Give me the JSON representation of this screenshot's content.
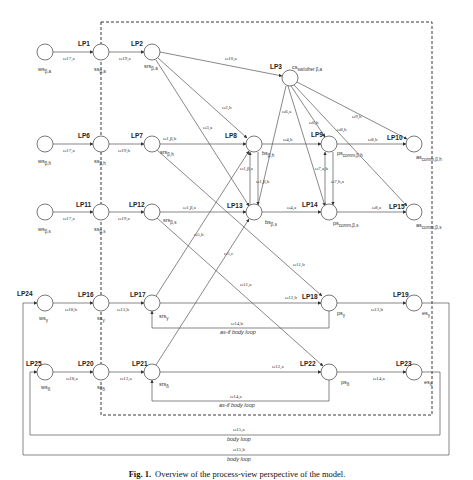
{
  "figure": {
    "caption_prefix": "Fig. 1.",
    "caption_text": "Overview of the process-view perspective of the model."
  },
  "nodes": [
    {
      "id": "ws_a",
      "label": "ws",
      "sub": "β,a",
      "x": 45,
      "y": 52
    },
    {
      "id": "ss_a",
      "label": "ss",
      "sub": "β,a",
      "x": 101,
      "y": 52
    },
    {
      "id": "srs_a",
      "label": "srs",
      "sub": "β,a",
      "x": 152,
      "y": 52
    },
    {
      "id": "cs",
      "label": "cs",
      "sub": "sw/other β,a",
      "x": 290,
      "y": 78
    },
    {
      "id": "ws_h",
      "label": "ws",
      "sub": "β,h",
      "x": 45,
      "y": 144
    },
    {
      "id": "ss_h",
      "label": "ss",
      "sub": "β,h",
      "x": 101,
      "y": 144
    },
    {
      "id": "srs_h",
      "label": "srs",
      "sub": "β,h",
      "x": 152,
      "y": 144
    },
    {
      "id": "bs_h",
      "label": "bs",
      "sub": "β,h",
      "x": 254,
      "y": 144
    },
    {
      "id": "ps_h",
      "label": "ps",
      "sub": "comm,β,h",
      "x": 329,
      "y": 144
    },
    {
      "id": "as_h",
      "label": "as",
      "sub": "comm,β,h",
      "x": 414,
      "y": 144
    },
    {
      "id": "ws_s",
      "label": "ws",
      "sub": "β,s",
      "x": 45,
      "y": 212
    },
    {
      "id": "ss_s",
      "label": "ss",
      "sub": "β,s",
      "x": 101,
      "y": 212
    },
    {
      "id": "srs_s",
      "label": "srs",
      "sub": "β,s",
      "x": 152,
      "y": 212
    },
    {
      "id": "bs_s",
      "label": "bs",
      "sub": "β,s",
      "x": 254,
      "y": 212
    },
    {
      "id": "ps_s",
      "label": "ps",
      "sub": "comm,β,s",
      "x": 329,
      "y": 212
    },
    {
      "id": "as_s",
      "label": "as",
      "sub": "comm,β,s",
      "x": 414,
      "y": 212
    },
    {
      "id": "ws_y",
      "label": "ws",
      "sub": "γ",
      "x": 45,
      "y": 303
    },
    {
      "id": "ss_y",
      "label": "ss",
      "sub": "γ",
      "x": 101,
      "y": 303
    },
    {
      "id": "srs_y",
      "label": "srs",
      "sub": "γ",
      "x": 152,
      "y": 303
    },
    {
      "id": "ps_y",
      "label": "ps",
      "sub": "γ",
      "x": 329,
      "y": 303
    },
    {
      "id": "es_y",
      "label": "es",
      "sub": "γ",
      "x": 414,
      "y": 303
    },
    {
      "id": "ws_d",
      "label": "ws",
      "sub": "δ",
      "x": 45,
      "y": 372
    },
    {
      "id": "ss_d",
      "label": "ss",
      "sub": "δ",
      "x": 101,
      "y": 372
    },
    {
      "id": "srs_d",
      "label": "srs",
      "sub": "δ",
      "x": 152,
      "y": 372
    },
    {
      "id": "ps_d",
      "label": "ps",
      "sub": "δ",
      "x": 329,
      "y": 372
    },
    {
      "id": "es_d",
      "label": "es",
      "sub": "δ",
      "x": 414,
      "y": 372
    }
  ],
  "lps": [
    "LP1",
    "LP2",
    "LP3",
    "LP6",
    "LP7",
    "LP8",
    "LP9",
    "LP10",
    "LP11",
    "LP12",
    "LP13",
    "LP14",
    "LP15",
    "LP16",
    "LP17",
    "LP18",
    "LP19",
    "LP20",
    "LP21",
    "LP22",
    "LP23",
    "LP24",
    "LP25"
  ],
  "edge_labels": {
    "e_ws_ss_a": "ω17,a",
    "e_ss_srs_a": "ω19,a",
    "e_srs_cs": "ω10,a",
    "e_srs_a_diag": "ω2,h",
    "e_srs_a_diag2": "ω3,a",
    "e_cs_1": "ω6,a",
    "e_cs_2": "ω6,h",
    "e_cs_3": "ω8,h",
    "e_cs_4": "ω9,h",
    "e_ws_ss_h": "ω17,a",
    "e_ss_srs_h": "ω19,h",
    "e_srs_bs_h": "ω1,β,h",
    "e_bs_ps_h": "ω4,h",
    "e_ps_as_h": "ω8,h",
    "e_bs_up": "ω1,β,a",
    "e_bs_down": "ω1,β,h",
    "e_ps_up": "ω7,a,h",
    "e_ps_down": "ω7,h,a",
    "e_ws_ss_s": "ω17,a",
    "e_ss_srs_s": "ω19,a",
    "e_srs_bs_s": "ω1,β,a",
    "e_bs_ps_s": "ω4,a",
    "e_ps_as_s": "ω8,a",
    "e_ws_ss_y": "ω18,b",
    "e_ss_srs_y": "ω13,b",
    "e_srs_ps_y": "ω12,b",
    "e_ps_es_y": "ω13,b",
    "e_asif_y": "ω14,b",
    "e_diag_y1": "ω5,b",
    "e_diag_y2": "ω5,c",
    "e_diag_y3": "ω11,a",
    "e_diag_y4": "ω11,b",
    "e_ws_ss_d": "ω18,a",
    "e_ss_srs_d": "ω13,a",
    "e_srs_ps_d": "ω12,a",
    "e_ps_es_d": "ω14,a",
    "e_asif_d": "ω14,a",
    "e_body1": "ω15,a",
    "e_body2": "ω15,b"
  },
  "loop_labels": {
    "asif_y": "as-if body loop",
    "asif_d": "as-if body loop",
    "body1": "body loop",
    "body2": "body loop"
  }
}
